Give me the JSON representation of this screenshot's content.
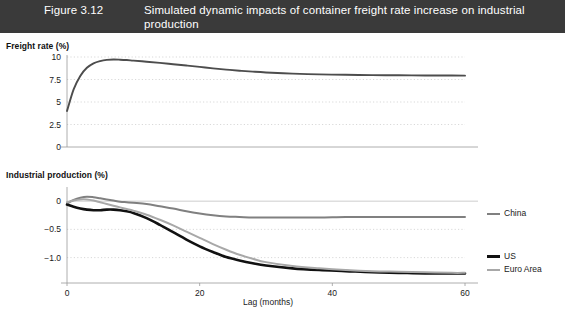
{
  "header": {
    "figure_number": "Figure 3.12",
    "title": "Simulated dynamic impacts of container freight rate increase on industrial production",
    "band_color": "#3a3a3a",
    "text_color": "#ffffff"
  },
  "panels": {
    "freight": {
      "title": "Freight rate (%)"
    },
    "industrial": {
      "title": "Industrial production (%)"
    }
  },
  "legend": {
    "items": [
      {
        "label": "China",
        "color": "#808080"
      },
      {
        "label": "US",
        "color": "#111111"
      },
      {
        "label": "Euro Area",
        "color": "#a8a8a8"
      }
    ]
  },
  "chart_data": [
    {
      "type": "line",
      "title": "Freight rate (%)",
      "xlabel": "",
      "ylabel": "",
      "xlim": [
        0,
        60
      ],
      "ylim": [
        0,
        10
      ],
      "xticks": [],
      "yticks": [
        0,
        2.5,
        5,
        7.5,
        10
      ],
      "ytick_labels": [
        "0",
        "2.5",
        "5",
        "7.5",
        "10"
      ],
      "grid": "horizontal-dotted",
      "legend_position": "none",
      "series": [
        {
          "name": "Freight rate",
          "color": "#4d4d4d",
          "x": [
            0,
            1,
            2,
            3,
            4,
            5,
            6,
            7,
            8,
            9,
            10,
            12,
            14,
            16,
            18,
            20,
            22,
            24,
            26,
            28,
            30,
            34,
            38,
            42,
            46,
            50,
            54,
            58,
            60
          ],
          "values": [
            4.0,
            6.4,
            7.9,
            8.8,
            9.3,
            9.55,
            9.68,
            9.72,
            9.7,
            9.66,
            9.6,
            9.48,
            9.35,
            9.2,
            9.05,
            8.9,
            8.74,
            8.6,
            8.48,
            8.37,
            8.28,
            8.15,
            8.07,
            8.02,
            7.99,
            7.97,
            7.95,
            7.94,
            7.93
          ]
        }
      ]
    },
    {
      "type": "line",
      "title": "Industrial production (%)",
      "xlabel": "Lag (months)",
      "ylabel": "",
      "xlim": [
        0,
        60
      ],
      "ylim": [
        -1.45,
        0.18
      ],
      "xticks": [
        0,
        20,
        40,
        60
      ],
      "xtick_labels": [
        "0",
        "20",
        "40",
        "60"
      ],
      "yticks": [
        0,
        -0.5,
        -1.0
      ],
      "ytick_labels": [
        "0",
        "−0.5",
        "−1.0"
      ],
      "grid": "horizontal-dotted",
      "legend_position": "right",
      "series": [
        {
          "name": "China",
          "color": "#808080",
          "x": [
            0,
            1,
            2,
            3,
            4,
            5,
            6,
            7,
            8,
            9,
            10,
            12,
            14,
            16,
            18,
            20,
            22,
            24,
            26,
            28,
            30,
            34,
            38,
            42,
            46,
            50,
            54,
            58,
            60
          ],
          "values": [
            -0.04,
            0.02,
            0.06,
            0.08,
            0.07,
            0.05,
            0.03,
            0.01,
            -0.01,
            -0.02,
            -0.03,
            -0.05,
            -0.09,
            -0.13,
            -0.18,
            -0.22,
            -0.25,
            -0.27,
            -0.28,
            -0.29,
            -0.29,
            -0.29,
            -0.29,
            -0.28,
            -0.28,
            -0.28,
            -0.28,
            -0.28,
            -0.28
          ]
        },
        {
          "name": "US",
          "color": "#111111",
          "x": [
            0,
            1,
            2,
            3,
            4,
            5,
            6,
            7,
            8,
            9,
            10,
            12,
            14,
            16,
            18,
            20,
            22,
            24,
            26,
            28,
            30,
            34,
            38,
            42,
            46,
            50,
            54,
            58,
            60
          ],
          "values": [
            -0.06,
            -0.1,
            -0.13,
            -0.15,
            -0.16,
            -0.16,
            -0.15,
            -0.15,
            -0.16,
            -0.18,
            -0.21,
            -0.3,
            -0.42,
            -0.55,
            -0.68,
            -0.8,
            -0.9,
            -0.99,
            -1.05,
            -1.1,
            -1.14,
            -1.19,
            -1.22,
            -1.24,
            -1.26,
            -1.27,
            -1.28,
            -1.28,
            -1.28
          ]
        },
        {
          "name": "Euro Area",
          "color": "#a8a8a8",
          "x": [
            0,
            1,
            2,
            3,
            4,
            5,
            6,
            7,
            8,
            9,
            10,
            12,
            14,
            16,
            18,
            20,
            22,
            24,
            26,
            28,
            30,
            34,
            38,
            42,
            46,
            50,
            54,
            58,
            60
          ],
          "values": [
            -0.02,
            0.01,
            0.03,
            0.03,
            0.01,
            -0.02,
            -0.05,
            -0.08,
            -0.11,
            -0.14,
            -0.17,
            -0.24,
            -0.33,
            -0.43,
            -0.54,
            -0.65,
            -0.76,
            -0.86,
            -0.95,
            -1.02,
            -1.08,
            -1.15,
            -1.19,
            -1.22,
            -1.24,
            -1.25,
            -1.26,
            -1.27,
            -1.27
          ]
        }
      ]
    }
  ]
}
